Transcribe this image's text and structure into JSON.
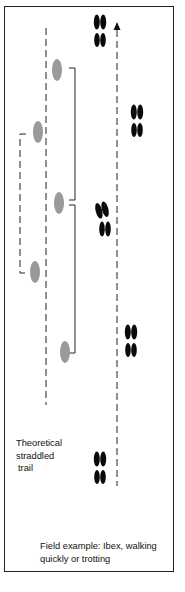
{
  "diagram": {
    "colors": {
      "theoretical_print": "#9a9a9a",
      "field_print": "#0a0a0a",
      "lines": "#222222",
      "frame": "#222222"
    },
    "theoretical_trail": {
      "label_lines": [
        "Theoretical",
        "straddled",
        "trail"
      ],
      "prints": [
        {
          "side": "right",
          "x": 57,
          "y": 70
        },
        {
          "side": "left",
          "x": 38,
          "y": 132
        },
        {
          "side": "right",
          "x": 59,
          "y": 203
        },
        {
          "side": "left",
          "x": 35,
          "y": 272
        },
        {
          "side": "right",
          "x": 65,
          "y": 352
        }
      ]
    },
    "field_trail": {
      "label_lines": [
        "Field example: Ibex, walking",
        "quickly or trotting"
      ],
      "direction": "up-arrow",
      "hoofprints": [
        {
          "x": 100,
          "y": 30
        },
        {
          "x": 137,
          "y": 120
        },
        {
          "x": 103,
          "y": 218
        },
        {
          "x": 131,
          "y": 340
        },
        {
          "x": 100,
          "y": 467
        }
      ]
    }
  }
}
